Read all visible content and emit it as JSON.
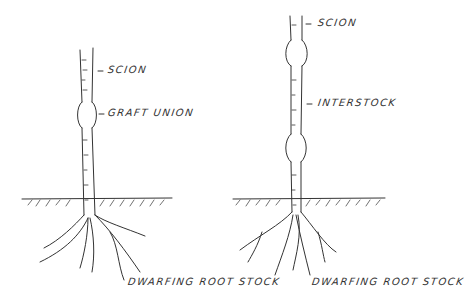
{
  "diagram": {
    "left_tree": {
      "labels": {
        "scion": "SCION",
        "graft_union": "GRAFT UNION",
        "rootstock": "DWARFING ROOT STOCK"
      }
    },
    "right_tree": {
      "labels": {
        "scion": "SCION",
        "interstock": "INTERSTOCK",
        "rootstock": "DWARFING ROOT STOCK"
      }
    },
    "colors": {
      "ink": "#333333",
      "background": "#ffffff"
    }
  }
}
